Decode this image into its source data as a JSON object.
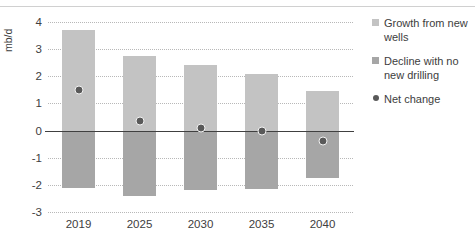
{
  "chart_data": {
    "type": "bar",
    "title": "",
    "subtitle": "",
    "xlabel": "",
    "ylabel": "mb/d",
    "categories": [
      "2019",
      "2025",
      "2030",
      "2035",
      "2040"
    ],
    "ylim": [
      -3,
      4
    ],
    "yticks": [
      "4",
      "3",
      "2",
      "1",
      "0",
      "-1",
      "-2",
      "-3"
    ],
    "ytick_values": [
      4,
      3,
      2,
      1,
      0,
      -1,
      -2,
      -3
    ],
    "grid": true,
    "legend_position": "right",
    "stacked": true,
    "series": [
      {
        "name": "Growth from new wells",
        "type": "bar",
        "color": "#c3c3c3",
        "values": [
          3.7,
          2.75,
          2.4,
          2.1,
          1.45
        ]
      },
      {
        "name": "Decline with no new drilling",
        "type": "bar",
        "color": "#a6a6a6",
        "values": [
          -2.1,
          -2.4,
          -2.2,
          -2.15,
          -1.75
        ]
      },
      {
        "name": "Net change",
        "type": "scatter",
        "color": "#595959",
        "values": [
          1.5,
          0.35,
          0.1,
          0.0,
          -0.4
        ]
      }
    ]
  },
  "legend": {
    "items": [
      {
        "label": "Growth from new wells",
        "marker": "square-swatch-icon",
        "color": "#c3c3c3"
      },
      {
        "label": "Decline with no new drilling",
        "marker": "square-swatch-icon",
        "color": "#a6a6a6"
      },
      {
        "label": "Net change",
        "marker": "circle-marker-icon",
        "color": "#595959"
      }
    ]
  }
}
